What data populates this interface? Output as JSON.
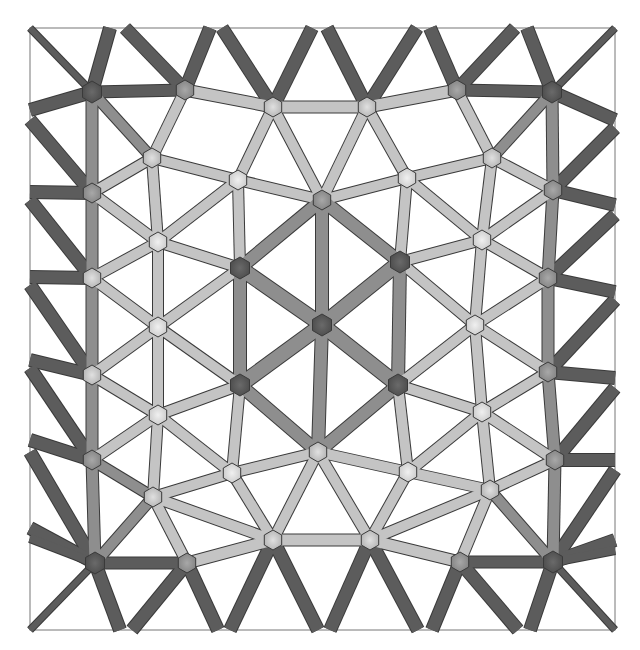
{
  "figure": {
    "type": "truss-mesh",
    "frame": {
      "x": 30,
      "y": 28,
      "width": 585,
      "height": 602,
      "stroke": "#777777"
    },
    "palette": {
      "dark": "#5a5a5a",
      "mid": "#8a8a8a",
      "light": "#bdbdbd",
      "lighter": "#d6d6d6",
      "outline": "#3a3a3a"
    },
    "nodes": [
      {
        "id": "n0",
        "x": 92,
        "y": 92,
        "shade": "dark"
      },
      {
        "id": "n1",
        "x": 185,
        "y": 90,
        "shade": "mid"
      },
      {
        "id": "n2",
        "x": 273,
        "y": 107,
        "shade": "light"
      },
      {
        "id": "n3",
        "x": 367,
        "y": 107,
        "shade": "light"
      },
      {
        "id": "n4",
        "x": 457,
        "y": 90,
        "shade": "mid"
      },
      {
        "id": "n5",
        "x": 552,
        "y": 92,
        "shade": "dark"
      },
      {
        "id": "n6",
        "x": 152,
        "y": 158,
        "shade": "light"
      },
      {
        "id": "n7",
        "x": 238,
        "y": 180,
        "shade": "lighter"
      },
      {
        "id": "n8",
        "x": 322,
        "y": 200,
        "shade": "mid"
      },
      {
        "id": "n9",
        "x": 407,
        "y": 178,
        "shade": "lighter"
      },
      {
        "id": "n10",
        "x": 492,
        "y": 158,
        "shade": "light"
      },
      {
        "id": "n11",
        "x": 92,
        "y": 193,
        "shade": "mid"
      },
      {
        "id": "n12",
        "x": 553,
        "y": 190,
        "shade": "mid"
      },
      {
        "id": "n13",
        "x": 158,
        "y": 242,
        "shade": "lighter"
      },
      {
        "id": "n14",
        "x": 240,
        "y": 268,
        "shade": "dark"
      },
      {
        "id": "n15",
        "x": 400,
        "y": 262,
        "shade": "dark"
      },
      {
        "id": "n16",
        "x": 482,
        "y": 240,
        "shade": "lighter"
      },
      {
        "id": "n17",
        "x": 92,
        "y": 278,
        "shade": "light"
      },
      {
        "id": "n18",
        "x": 548,
        "y": 278,
        "shade": "mid"
      },
      {
        "id": "n19",
        "x": 158,
        "y": 327,
        "shade": "lighter"
      },
      {
        "id": "n20",
        "x": 322,
        "y": 325,
        "shade": "dark"
      },
      {
        "id": "n21",
        "x": 475,
        "y": 325,
        "shade": "lighter"
      },
      {
        "id": "n22",
        "x": 92,
        "y": 375,
        "shade": "light"
      },
      {
        "id": "n23",
        "x": 548,
        "y": 372,
        "shade": "mid"
      },
      {
        "id": "n24",
        "x": 158,
        "y": 415,
        "shade": "lighter"
      },
      {
        "id": "n25",
        "x": 240,
        "y": 385,
        "shade": "dark"
      },
      {
        "id": "n26",
        "x": 398,
        "y": 385,
        "shade": "dark"
      },
      {
        "id": "n27",
        "x": 482,
        "y": 412,
        "shade": "lighter"
      },
      {
        "id": "n28",
        "x": 92,
        "y": 460,
        "shade": "mid"
      },
      {
        "id": "n29",
        "x": 555,
        "y": 460,
        "shade": "mid"
      },
      {
        "id": "n30",
        "x": 232,
        "y": 473,
        "shade": "lighter"
      },
      {
        "id": "n31",
        "x": 318,
        "y": 452,
        "shade": "light"
      },
      {
        "id": "n32",
        "x": 408,
        "y": 472,
        "shade": "lighter"
      },
      {
        "id": "n33",
        "x": 153,
        "y": 497,
        "shade": "light"
      },
      {
        "id": "n34",
        "x": 490,
        "y": 490,
        "shade": "light"
      },
      {
        "id": "n35",
        "x": 95,
        "y": 563,
        "shade": "dark"
      },
      {
        "id": "n36",
        "x": 187,
        "y": 563,
        "shade": "mid"
      },
      {
        "id": "n37",
        "x": 273,
        "y": 540,
        "shade": "light"
      },
      {
        "id": "n38",
        "x": 370,
        "y": 540,
        "shade": "light"
      },
      {
        "id": "n39",
        "x": 460,
        "y": 562,
        "shade": "mid"
      },
      {
        "id": "n40",
        "x": 553,
        "y": 562,
        "shade": "dark"
      }
    ],
    "boundary_points": {
      "top": [
        {
          "id": "t0",
          "x": 30,
          "y": 28
        },
        {
          "id": "t1",
          "x": 110,
          "y": 28
        },
        {
          "id": "t2",
          "x": 125,
          "y": 28
        },
        {
          "id": "t3",
          "x": 210,
          "y": 28
        },
        {
          "id": "t4",
          "x": 222,
          "y": 28
        },
        {
          "id": "t5",
          "x": 312,
          "y": 28
        },
        {
          "id": "t6",
          "x": 327,
          "y": 28
        },
        {
          "id": "t7",
          "x": 417,
          "y": 28
        },
        {
          "id": "t8",
          "x": 430,
          "y": 28
        },
        {
          "id": "t9",
          "x": 515,
          "y": 28
        },
        {
          "id": "t10",
          "x": 527,
          "y": 28
        },
        {
          "id": "t11",
          "x": 615,
          "y": 28
        }
      ],
      "bottom": [
        {
          "id": "b0",
          "x": 30,
          "y": 630
        },
        {
          "id": "b1",
          "x": 120,
          "y": 630
        },
        {
          "id": "b2",
          "x": 132,
          "y": 630
        },
        {
          "id": "b3",
          "x": 218,
          "y": 630
        },
        {
          "id": "b4",
          "x": 230,
          "y": 630
        },
        {
          "id": "b5",
          "x": 318,
          "y": 630
        },
        {
          "id": "b6",
          "x": 330,
          "y": 630
        },
        {
          "id": "b7",
          "x": 418,
          "y": 630
        },
        {
          "id": "b8",
          "x": 432,
          "y": 630
        },
        {
          "id": "b9",
          "x": 518,
          "y": 630
        },
        {
          "id": "b10",
          "x": 530,
          "y": 630
        },
        {
          "id": "b11",
          "x": 615,
          "y": 630
        }
      ],
      "left": [
        {
          "id": "l1",
          "x": 30,
          "y": 110
        },
        {
          "id": "l2",
          "x": 30,
          "y": 120
        },
        {
          "id": "l3",
          "x": 30,
          "y": 192
        },
        {
          "id": "l4",
          "x": 30,
          "y": 200
        },
        {
          "id": "l5",
          "x": 30,
          "y": 277
        },
        {
          "id": "l6",
          "x": 30,
          "y": 285
        },
        {
          "id": "l7",
          "x": 30,
          "y": 360
        },
        {
          "id": "l8",
          "x": 30,
          "y": 368
        },
        {
          "id": "l9",
          "x": 30,
          "y": 440
        },
        {
          "id": "l10",
          "x": 30,
          "y": 452
        },
        {
          "id": "l11",
          "x": 30,
          "y": 528
        },
        {
          "id": "l12",
          "x": 30,
          "y": 538
        }
      ],
      "right": [
        {
          "id": "r1",
          "x": 615,
          "y": 120
        },
        {
          "id": "r2",
          "x": 615,
          "y": 128
        },
        {
          "id": "r3",
          "x": 615,
          "y": 205
        },
        {
          "id": "r4",
          "x": 615,
          "y": 215
        },
        {
          "id": "r5",
          "x": 615,
          "y": 292
        },
        {
          "id": "r6",
          "x": 615,
          "y": 300
        },
        {
          "id": "r7",
          "x": 615,
          "y": 378
        },
        {
          "id": "r8",
          "x": 615,
          "y": 388
        },
        {
          "id": "r9",
          "x": 615,
          "y": 460
        },
        {
          "id": "r10",
          "x": 615,
          "y": 470
        },
        {
          "id": "r11",
          "x": 615,
          "y": 540
        },
        {
          "id": "r12",
          "x": 615,
          "y": 550
        }
      ]
    },
    "edges": [
      [
        "t0",
        "n0",
        "dark",
        6
      ],
      [
        "t1",
        "n0",
        "dark",
        12
      ],
      [
        "t2",
        "n1",
        "dark",
        12
      ],
      [
        "t3",
        "n1",
        "dark",
        12
      ],
      [
        "t4",
        "n2",
        "dark",
        12
      ],
      [
        "t5",
        "n2",
        "dark",
        12
      ],
      [
        "t6",
        "n3",
        "dark",
        12
      ],
      [
        "t7",
        "n3",
        "dark",
        12
      ],
      [
        "t8",
        "n4",
        "dark",
        12
      ],
      [
        "t9",
        "n4",
        "dark",
        12
      ],
      [
        "t10",
        "n5",
        "dark",
        12
      ],
      [
        "t11",
        "n5",
        "dark",
        6
      ],
      [
        "b0",
        "n35",
        "dark",
        6
      ],
      [
        "b1",
        "n35",
        "dark",
        12
      ],
      [
        "b2",
        "n36",
        "dark",
        12
      ],
      [
        "b3",
        "n36",
        "dark",
        12
      ],
      [
        "b4",
        "n37",
        "dark",
        12
      ],
      [
        "b5",
        "n37",
        "dark",
        12
      ],
      [
        "b6",
        "n38",
        "dark",
        12
      ],
      [
        "b7",
        "n38",
        "dark",
        12
      ],
      [
        "b8",
        "n39",
        "dark",
        12
      ],
      [
        "b9",
        "n39",
        "dark",
        12
      ],
      [
        "b10",
        "n40",
        "dark",
        12
      ],
      [
        "b11",
        "n40",
        "dark",
        6
      ],
      [
        "l1",
        "n0",
        "dark",
        12
      ],
      [
        "l2",
        "n11",
        "dark",
        12
      ],
      [
        "l3",
        "n11",
        "dark",
        12
      ],
      [
        "l4",
        "n17",
        "dark",
        12
      ],
      [
        "l5",
        "n17",
        "dark",
        12
      ],
      [
        "l6",
        "n22",
        "dark",
        12
      ],
      [
        "l7",
        "n22",
        "dark",
        12
      ],
      [
        "l8",
        "n28",
        "dark",
        12
      ],
      [
        "l9",
        "n28",
        "dark",
        12
      ],
      [
        "l10",
        "n35",
        "dark",
        12
      ],
      [
        "l11",
        "n35",
        "dark",
        12
      ],
      [
        "l12",
        "n35",
        "dark",
        8
      ],
      [
        "r1",
        "n5",
        "dark",
        12
      ],
      [
        "r2",
        "n12",
        "dark",
        12
      ],
      [
        "r3",
        "n12",
        "dark",
        12
      ],
      [
        "r4",
        "n18",
        "dark",
        12
      ],
      [
        "r5",
        "n18",
        "dark",
        12
      ],
      [
        "r6",
        "n23",
        "dark",
        12
      ],
      [
        "r7",
        "n23",
        "dark",
        12
      ],
      [
        "r8",
        "n29",
        "dark",
        12
      ],
      [
        "r9",
        "n29",
        "dark",
        12
      ],
      [
        "r10",
        "n40",
        "dark",
        12
      ],
      [
        "r11",
        "n40",
        "dark",
        12
      ],
      [
        "r12",
        "n40",
        "dark",
        8
      ],
      [
        "n0",
        "n1",
        "dark",
        11
      ],
      [
        "n1",
        "n2",
        "light",
        11
      ],
      [
        "n2",
        "n3",
        "light",
        11
      ],
      [
        "n3",
        "n4",
        "light",
        11
      ],
      [
        "n4",
        "n5",
        "dark",
        11
      ],
      [
        "n35",
        "n36",
        "dark",
        11
      ],
      [
        "n36",
        "n37",
        "light",
        11
      ],
      [
        "n37",
        "n38",
        "light",
        11
      ],
      [
        "n38",
        "n39",
        "light",
        11
      ],
      [
        "n39",
        "n40",
        "dark",
        11
      ],
      [
        "n0",
        "n11",
        "mid",
        11
      ],
      [
        "n11",
        "n17",
        "mid",
        11
      ],
      [
        "n17",
        "n22",
        "mid",
        11
      ],
      [
        "n22",
        "n28",
        "mid",
        11
      ],
      [
        "n28",
        "n35",
        "mid",
        11
      ],
      [
        "n5",
        "n12",
        "mid",
        11
      ],
      [
        "n12",
        "n18",
        "mid",
        11
      ],
      [
        "n18",
        "n23",
        "mid",
        11
      ],
      [
        "n23",
        "n29",
        "mid",
        11
      ],
      [
        "n29",
        "n40",
        "mid",
        11
      ],
      [
        "n0",
        "n6",
        "mid",
        10
      ],
      [
        "n1",
        "n6",
        "light",
        10
      ],
      [
        "n2",
        "n7",
        "light",
        10
      ],
      [
        "n2",
        "n8",
        "light",
        10
      ],
      [
        "n3",
        "n8",
        "light",
        10
      ],
      [
        "n3",
        "n9",
        "light",
        10
      ],
      [
        "n4",
        "n10",
        "light",
        10
      ],
      [
        "n5",
        "n10",
        "mid",
        10
      ],
      [
        "n6",
        "n7",
        "light",
        10
      ],
      [
        "n7",
        "n8",
        "light",
        10
      ],
      [
        "n8",
        "n9",
        "light",
        10
      ],
      [
        "n9",
        "n10",
        "light",
        10
      ],
      [
        "n6",
        "n11",
        "light",
        10
      ],
      [
        "n6",
        "n13",
        "light",
        10
      ],
      [
        "n7",
        "n13",
        "light",
        10
      ],
      [
        "n7",
        "n14",
        "light",
        10
      ],
      [
        "n8",
        "n20",
        "mid",
        12
      ],
      [
        "n9",
        "n15",
        "light",
        10
      ],
      [
        "n9",
        "n16",
        "light",
        10
      ],
      [
        "n10",
        "n16",
        "light",
        10
      ],
      [
        "n10",
        "n12",
        "light",
        10
      ],
      [
        "n11",
        "n13",
        "light",
        10
      ],
      [
        "n13",
        "n14",
        "light",
        10
      ],
      [
        "n13",
        "n17",
        "light",
        10
      ],
      [
        "n13",
        "n19",
        "light",
        10
      ],
      [
        "n14",
        "n8",
        "mid",
        12
      ],
      [
        "n14",
        "n20",
        "mid",
        14
      ],
      [
        "n14",
        "n19",
        "light",
        10
      ],
      [
        "n14",
        "n25",
        "mid",
        12
      ],
      [
        "n15",
        "n8",
        "mid",
        12
      ],
      [
        "n15",
        "n20",
        "mid",
        14
      ],
      [
        "n15",
        "n16",
        "light",
        10
      ],
      [
        "n15",
        "n21",
        "light",
        10
      ],
      [
        "n15",
        "n26",
        "mid",
        12
      ],
      [
        "n16",
        "n12",
        "light",
        10
      ],
      [
        "n16",
        "n18",
        "light",
        10
      ],
      [
        "n16",
        "n21",
        "light",
        10
      ],
      [
        "n17",
        "n19",
        "light",
        10
      ],
      [
        "n19",
        "n22",
        "light",
        10
      ],
      [
        "n19",
        "n24",
        "light",
        10
      ],
      [
        "n19",
        "n25",
        "light",
        10
      ],
      [
        "n21",
        "n18",
        "light",
        10
      ],
      [
        "n21",
        "n23",
        "light",
        10
      ],
      [
        "n21",
        "n26",
        "light",
        10
      ],
      [
        "n21",
        "n27",
        "light",
        10
      ],
      [
        "n20",
        "n25",
        "mid",
        14
      ],
      [
        "n20",
        "n26",
        "mid",
        14
      ],
      [
        "n20",
        "n31",
        "mid",
        12
      ],
      [
        "n22",
        "n24",
        "light",
        10
      ],
      [
        "n24",
        "n25",
        "light",
        10
      ],
      [
        "n24",
        "n28",
        "light",
        10
      ],
      [
        "n24",
        "n30",
        "light",
        10
      ],
      [
        "n24",
        "n33",
        "light",
        10
      ],
      [
        "n25",
        "n30",
        "light",
        10
      ],
      [
        "n25",
        "n31",
        "mid",
        12
      ],
      [
        "n26",
        "n31",
        "mid",
        12
      ],
      [
        "n26",
        "n32",
        "light",
        10
      ],
      [
        "n26",
        "n27",
        "light",
        10
      ],
      [
        "n27",
        "n23",
        "light",
        10
      ],
      [
        "n27",
        "n29",
        "light",
        10
      ],
      [
        "n27",
        "n32",
        "light",
        10
      ],
      [
        "n27",
        "n34",
        "light",
        10
      ],
      [
        "n28",
        "n33",
        "mid",
        10
      ],
      [
        "n30",
        "n31",
        "light",
        10
      ],
      [
        "n30",
        "n33",
        "light",
        10
      ],
      [
        "n30",
        "n37",
        "light",
        10
      ],
      [
        "n31",
        "n32",
        "light",
        10
      ],
      [
        "n32",
        "n34",
        "light",
        10
      ],
      [
        "n32",
        "n38",
        "light",
        10
      ],
      [
        "n31",
        "n37",
        "light",
        10
      ],
      [
        "n31",
        "n38",
        "light",
        10
      ],
      [
        "n33",
        "n35",
        "mid",
        10
      ],
      [
        "n33",
        "n36",
        "light",
        10
      ],
      [
        "n33",
        "n37",
        "light",
        10
      ],
      [
        "n34",
        "n29",
        "light",
        10
      ],
      [
        "n34",
        "n39",
        "light",
        10
      ],
      [
        "n34",
        "n40",
        "mid",
        10
      ],
      [
        "n34",
        "n38",
        "light",
        10
      ]
    ]
  }
}
